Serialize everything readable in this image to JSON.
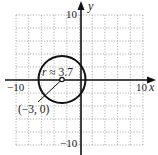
{
  "chart_data": {
    "type": "scatter",
    "title": "",
    "xlabel": "x",
    "ylabel": "y",
    "xlim": [
      -10,
      10
    ],
    "ylim": [
      -10,
      10
    ],
    "grid": true,
    "grid_step": 2,
    "x_tick_labels": [
      "-10",
      "10"
    ],
    "y_tick_labels": [
      "10",
      "-10"
    ],
    "shapes": [
      {
        "kind": "circle",
        "center": [
          -3,
          0
        ],
        "radius": 3.7
      }
    ],
    "points": [
      {
        "x": -3,
        "y": 0,
        "label": "(−3, 0)",
        "marker": "open-circle"
      }
    ],
    "annotations": [
      {
        "text": "r ≈ 3.7",
        "near": [
          -3,
          0
        ]
      },
      {
        "text": "(−3, 0)",
        "near": [
          -3,
          0
        ],
        "leader_line": true
      }
    ]
  },
  "labels": {
    "x_axis_name": "x",
    "y_axis_name": "y",
    "x_min_tick": "−10",
    "x_max_tick": "10",
    "y_max_tick": "10",
    "y_min_tick": "−10",
    "radius_r": "r",
    "radius_value": " ≈ 3.7",
    "center_label": "(−3, 0)"
  },
  "colors": {
    "axis": "#111111",
    "grid": "#9a9a9a",
    "circle": "#111111",
    "background": "#ffffff"
  }
}
